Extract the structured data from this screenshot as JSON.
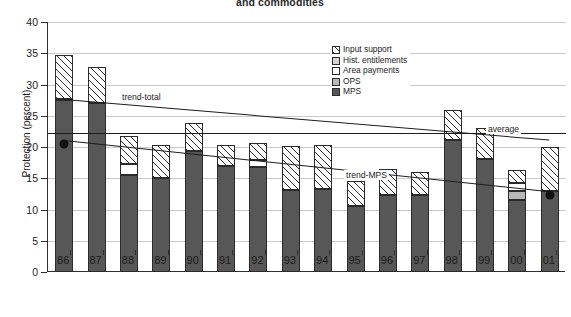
{
  "chart_data": {
    "type": "bar",
    "title": "and commodities",
    "subtitle": "",
    "xlabel": "",
    "ylabel": "Protection (percent)",
    "ylim": [
      0,
      40
    ],
    "ytick_step": 5,
    "yticks": [
      "40",
      "35",
      "30",
      "25",
      "20",
      "15",
      "10",
      "5",
      "0"
    ],
    "grid": true,
    "legend_position": "inside-top-right",
    "stacked": true,
    "categories": [
      "86",
      "87",
      "88",
      "89",
      "90",
      "91",
      "92",
      "93",
      "94",
      "95",
      "96",
      "97",
      "98",
      "99",
      "00",
      "01"
    ],
    "series": [
      {
        "name": "MPS",
        "key": "mps",
        "color": "#575757",
        "values": [
          27.5,
          27.0,
          15.5,
          15.0,
          19.3,
          17.0,
          16.8,
          13.1,
          13.3,
          10.6,
          12.4,
          12.4,
          21.2,
          18.1,
          11.5,
          13.0
        ]
      },
      {
        "name": "OPS",
        "key": "ops",
        "color": "#b8b8b8",
        "values": [
          0,
          0,
          0,
          0,
          0,
          0,
          0,
          0,
          0,
          0,
          0,
          0,
          0,
          0,
          1.5,
          0
        ]
      },
      {
        "name": "Area payments",
        "key": "area",
        "color": "#ffffff",
        "values": [
          0,
          0,
          1.8,
          0,
          0,
          0,
          1.2,
          0,
          0,
          0,
          0,
          0,
          0,
          0,
          1.2,
          0
        ]
      },
      {
        "name": "Hist. entitlements",
        "key": "hist",
        "color": "#d5d5d5",
        "values": [
          0.2,
          0,
          0,
          0,
          0,
          0,
          0,
          0,
          0,
          0,
          0,
          0,
          0,
          0,
          0,
          0
        ]
      },
      {
        "name": "Input support",
        "key": "input",
        "color": "hatched",
        "values": [
          7.0,
          5.8,
          4.4,
          5.3,
          4.5,
          3.3,
          2.6,
          7.1,
          7.1,
          4.0,
          4.1,
          3.6,
          4.8,
          4.9,
          2.1,
          7.0
        ]
      }
    ],
    "totals": [
      34.7,
      32.8,
      21.7,
      20.3,
      23.8,
      20.3,
      20.6,
      20.2,
      20.4,
      14.6,
      16.5,
      16.0,
      26.0,
      23.0,
      16.3,
      20.0
    ],
    "annotations": [
      {
        "name": "trend-total",
        "label": "trend-total"
      },
      {
        "name": "trend-MPS",
        "label": "trend-MPS"
      },
      {
        "name": "average",
        "label": "average"
      }
    ],
    "trend_total": {
      "label": "trend-total",
      "start_value": 27.7,
      "end_value": 21.2
    },
    "trend_mps": {
      "label": "trend-MPS",
      "start_value": 21.2,
      "end_value": 13.0
    },
    "average_line": {
      "label": "average",
      "value": 22.2
    },
    "markers": [
      {
        "category": "86",
        "value": 21.2
      },
      {
        "category": "01",
        "value": 13.0
      }
    ]
  },
  "legend": {
    "items": [
      {
        "label": "Input support",
        "swatch": "input"
      },
      {
        "label": "Hist. entitlements",
        "swatch": "hist"
      },
      {
        "label": "Area payments",
        "swatch": "area"
      },
      {
        "label": "OPS",
        "swatch": "ops"
      },
      {
        "label": "MPS",
        "swatch": "mps"
      }
    ]
  }
}
